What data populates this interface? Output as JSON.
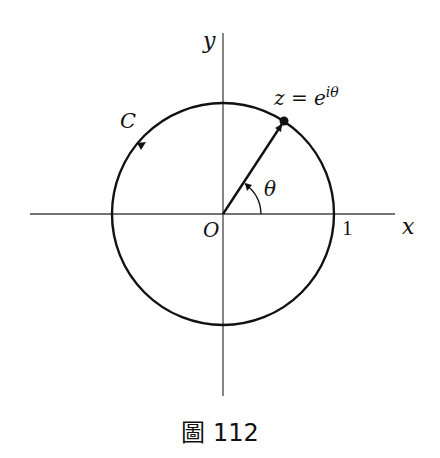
{
  "figure": {
    "caption": "圖 112",
    "labels": {
      "y_axis": "y",
      "x_axis": "x",
      "origin": "O",
      "curve": "C",
      "point": "z = e",
      "point_exponent": "iθ",
      "angle": "θ",
      "unit": "1"
    },
    "geometry": {
      "center": [
        223,
        214
      ],
      "radius": 111,
      "point": [
        284,
        121
      ],
      "stroke_color": "#111111"
    }
  }
}
